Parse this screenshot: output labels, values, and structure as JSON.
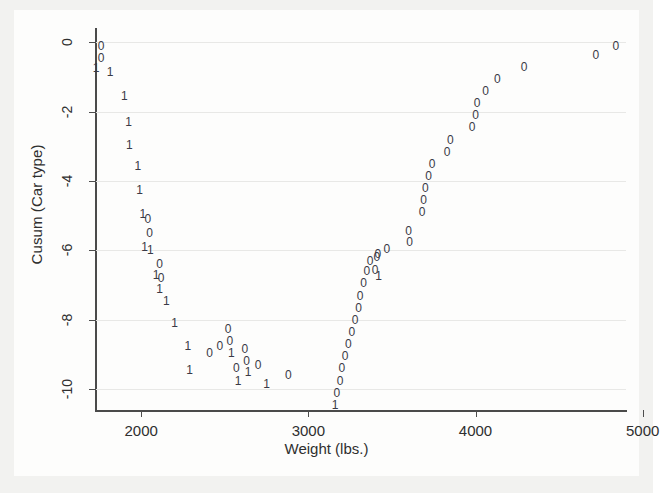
{
  "figure": {
    "background_color": "#f2f2f0",
    "plot_background_color": "#fdfdfc",
    "marker_color": "#3a3a46",
    "axis_color": "#4a4a4a",
    "grid_color": "#e8e8e6"
  },
  "axes": {
    "ylabel": "Cusum (Car type)",
    "xlabel": "Weight (lbs.)",
    "yticks": [
      "0",
      "-2",
      "-4",
      "-6",
      "-8",
      "-10"
    ],
    "xticks": [
      "2000",
      "3000",
      "4000",
      "5000"
    ]
  },
  "chart_data": {
    "type": "scatter",
    "title": "",
    "subtitle": "",
    "xlabel": "Weight (lbs.)",
    "ylabel": "Cusum (Car type)",
    "xlim": [
      1730,
      4900
    ],
    "ylim": [
      -10.6,
      0.3
    ],
    "xticks": [
      2000,
      3000,
      4000,
      5000
    ],
    "yticks": [
      0,
      -2,
      -4,
      -6,
      -8,
      -10
    ],
    "grid": "horizontal",
    "legend": "none",
    "marker_labels": [
      "0",
      "1"
    ],
    "marker_label_meaning": "Car type code plotted as the point glyph (0 = domestic, 1 = foreign)",
    "points": [
      {
        "x": 1760,
        "y": -0.1,
        "label": "0"
      },
      {
        "x": 1760,
        "y": -0.45,
        "label": "0"
      },
      {
        "x": 1730,
        "y": -0.75,
        "label": "1"
      },
      {
        "x": 1815,
        "y": -0.85,
        "label": "1"
      },
      {
        "x": 1900,
        "y": -1.55,
        "label": "1"
      },
      {
        "x": 1925,
        "y": -2.3,
        "label": "1"
      },
      {
        "x": 1930,
        "y": -2.95,
        "label": "1"
      },
      {
        "x": 1980,
        "y": -3.55,
        "label": "1"
      },
      {
        "x": 1990,
        "y": -4.25,
        "label": "1"
      },
      {
        "x": 2010,
        "y": -4.95,
        "label": "1"
      },
      {
        "x": 2040,
        "y": -5.1,
        "label": "0"
      },
      {
        "x": 2050,
        "y": -5.5,
        "label": "0"
      },
      {
        "x": 2020,
        "y": -5.9,
        "label": "1"
      },
      {
        "x": 2055,
        "y": -6.0,
        "label": "1"
      },
      {
        "x": 2110,
        "y": -6.4,
        "label": "0"
      },
      {
        "x": 2090,
        "y": -6.7,
        "label": "1"
      },
      {
        "x": 2120,
        "y": -6.8,
        "label": "0"
      },
      {
        "x": 2110,
        "y": -7.1,
        "label": "1"
      },
      {
        "x": 2150,
        "y": -7.45,
        "label": "1"
      },
      {
        "x": 2200,
        "y": -8.1,
        "label": "1"
      },
      {
        "x": 2280,
        "y": -8.75,
        "label": "1"
      },
      {
        "x": 2290,
        "y": -9.45,
        "label": "1"
      },
      {
        "x": 2410,
        "y": -8.95,
        "label": "0"
      },
      {
        "x": 2470,
        "y": -8.75,
        "label": "0"
      },
      {
        "x": 2520,
        "y": -8.25,
        "label": "0"
      },
      {
        "x": 2530,
        "y": -8.6,
        "label": "0"
      },
      {
        "x": 2540,
        "y": -8.95,
        "label": "1"
      },
      {
        "x": 2570,
        "y": -9.4,
        "label": "0"
      },
      {
        "x": 2580,
        "y": -9.75,
        "label": "1"
      },
      {
        "x": 2620,
        "y": -8.85,
        "label": "0"
      },
      {
        "x": 2630,
        "y": -9.2,
        "label": "0"
      },
      {
        "x": 2640,
        "y": -9.5,
        "label": "1"
      },
      {
        "x": 2700,
        "y": -9.3,
        "label": "0"
      },
      {
        "x": 2750,
        "y": -9.85,
        "label": "1"
      },
      {
        "x": 2880,
        "y": -9.6,
        "label": "0"
      },
      {
        "x": 3160,
        "y": -10.45,
        "label": "1"
      },
      {
        "x": 3170,
        "y": -10.1,
        "label": "0"
      },
      {
        "x": 3190,
        "y": -9.75,
        "label": "0"
      },
      {
        "x": 3200,
        "y": -9.4,
        "label": "0"
      },
      {
        "x": 3220,
        "y": -9.05,
        "label": "0"
      },
      {
        "x": 3240,
        "y": -8.7,
        "label": "0"
      },
      {
        "x": 3260,
        "y": -8.35,
        "label": "0"
      },
      {
        "x": 3280,
        "y": -8.0,
        "label": "0"
      },
      {
        "x": 3300,
        "y": -7.65,
        "label": "0"
      },
      {
        "x": 3310,
        "y": -7.3,
        "label": "0"
      },
      {
        "x": 3330,
        "y": -6.95,
        "label": "0"
      },
      {
        "x": 3350,
        "y": -6.6,
        "label": "0"
      },
      {
        "x": 3370,
        "y": -6.3,
        "label": "0"
      },
      {
        "x": 3400,
        "y": -6.55,
        "label": "0"
      },
      {
        "x": 3410,
        "y": -6.2,
        "label": "0"
      },
      {
        "x": 3415,
        "y": -6.1,
        "label": "0"
      },
      {
        "x": 3420,
        "y": -6.75,
        "label": "1"
      },
      {
        "x": 3470,
        "y": -5.95,
        "label": "0"
      },
      {
        "x": 3600,
        "y": -5.45,
        "label": "0"
      },
      {
        "x": 3605,
        "y": -5.75,
        "label": "0"
      },
      {
        "x": 3680,
        "y": -4.9,
        "label": "0"
      },
      {
        "x": 3690,
        "y": -4.55,
        "label": "0"
      },
      {
        "x": 3700,
        "y": -4.2,
        "label": "0"
      },
      {
        "x": 3720,
        "y": -3.85,
        "label": "0"
      },
      {
        "x": 3740,
        "y": -3.5,
        "label": "0"
      },
      {
        "x": 3830,
        "y": -3.15,
        "label": "0"
      },
      {
        "x": 3850,
        "y": -2.8,
        "label": "0"
      },
      {
        "x": 3980,
        "y": -2.45,
        "label": "0"
      },
      {
        "x": 4000,
        "y": -2.1,
        "label": "0"
      },
      {
        "x": 4010,
        "y": -1.75,
        "label": "0"
      },
      {
        "x": 4060,
        "y": -1.4,
        "label": "0"
      },
      {
        "x": 4130,
        "y": -1.05,
        "label": "0"
      },
      {
        "x": 4290,
        "y": -0.7,
        "label": "0"
      },
      {
        "x": 4720,
        "y": -0.35,
        "label": "0"
      },
      {
        "x": 4840,
        "y": -0.1,
        "label": "0"
      }
    ]
  }
}
